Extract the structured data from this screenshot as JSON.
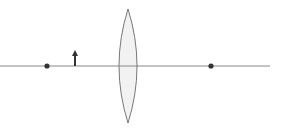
{
  "diagram": {
    "type": "converging-lens-ray-diagram",
    "colors": {
      "axis": "#888888",
      "lens_stroke": "#777777",
      "lens_fill": "#f2f2f2",
      "dot": "#333333",
      "arrow": "#333333"
    },
    "axis": {
      "y": 66,
      "x_start": 0,
      "x_end": 270
    },
    "lens": {
      "cx": 128,
      "top": 9,
      "bottom": 123,
      "half_width": 9
    },
    "focal_points": [
      {
        "label": "left-focal-point",
        "x": 47
      },
      {
        "label": "right-focal-point",
        "x": 211
      }
    ],
    "object_arrow": {
      "x": 75,
      "base_y": 66,
      "tip_y": 51
    }
  }
}
